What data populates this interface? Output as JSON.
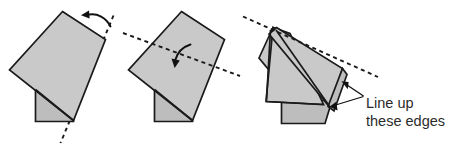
{
  "figure": {
    "kind": "origami-folding-instructions",
    "panel_count": 3,
    "background_color": "#ffffff",
    "paper_fill_color": "#c9c9c9",
    "paper_fill_shaded_color": "#bdbdbd",
    "outline_color": "#1a1a1a",
    "text_color": "#2b2b2b"
  },
  "annotations": {
    "callout": {
      "line1": "Line up",
      "line2": "these edges"
    }
  },
  "panels": [
    {
      "id": "panel-1",
      "name": "rotate-step",
      "fold_line": "dashed-diagonal-right-edge",
      "arrow": "curved-arrow-pointing-left"
    },
    {
      "id": "panel-2",
      "name": "fold-step",
      "fold_line": "dashed-shallow-diagonal-across-middle",
      "arrow": "curved-arrow-pointing-down"
    },
    {
      "id": "panel-3",
      "name": "result-step",
      "fold_line": "dashed-shallow-diagonal-top",
      "arrow": "two-pointer-arrows-to-edges"
    }
  ]
}
